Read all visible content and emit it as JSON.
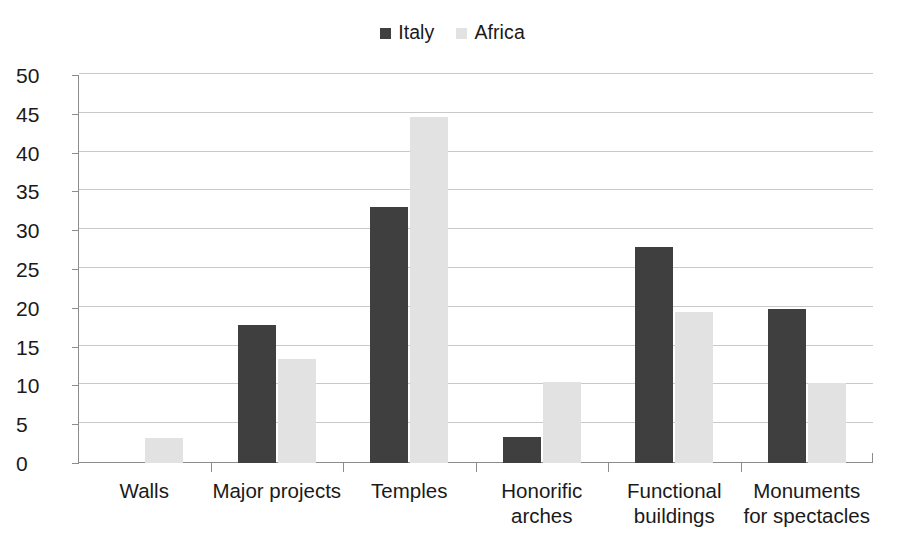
{
  "chart_data": {
    "type": "bar",
    "title": "",
    "subtitle": "",
    "xlabel": "",
    "ylabel": "",
    "ylim": [
      0,
      50
    ],
    "ytick_step": 5,
    "yticks": [
      0,
      5,
      10,
      15,
      20,
      25,
      30,
      35,
      40,
      45,
      50
    ],
    "ytick_labels": [
      "0",
      "5",
      "10",
      "15",
      "20",
      "25",
      "30",
      "35",
      "40",
      "45",
      "50"
    ],
    "grid": true,
    "grid_axis": "y",
    "legend_position": "top-center",
    "categories": [
      "Walls",
      "Major projects",
      "Temples",
      "Honorific arches",
      "Functional buildings",
      "Monuments for spectacles"
    ],
    "category_label_lines": [
      [
        "Walls"
      ],
      [
        "Major projects"
      ],
      [
        "Temples"
      ],
      [
        "Honorific",
        "arches"
      ],
      [
        "Functional",
        "buildings"
      ],
      [
        "Monuments",
        "for spectacles"
      ]
    ],
    "series": [
      {
        "name": "Italy",
        "color": "#3f3f3f",
        "values": [
          0,
          17.8,
          33.0,
          3.3,
          27.8,
          19.8
        ]
      },
      {
        "name": "Africa",
        "color": "#e2e2e2",
        "values": [
          3.2,
          13.4,
          44.6,
          10.5,
          19.4,
          10.3
        ]
      }
    ]
  },
  "legend": {
    "entries": [
      {
        "label": "Italy",
        "color": "#3f3f3f",
        "swatch_icon": "square-swatch-icon"
      },
      {
        "label": "Africa",
        "color": "#e2e2e2",
        "swatch_icon": "square-swatch-icon"
      }
    ]
  },
  "colors": {
    "italy": "#3f3f3f",
    "africa": "#e2e2e2",
    "gridline": "#c9c9c9",
    "axis": "#8c8c8c",
    "text": "#1a1a1a",
    "background": "#ffffff"
  }
}
